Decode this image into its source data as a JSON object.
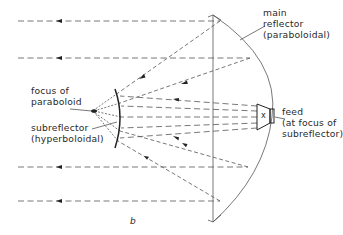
{
  "diagram": {
    "type": "cassegrain-antenna-ray-diagram",
    "caption": "b",
    "labels": {
      "main_reflector": [
        "main",
        "reflector",
        "(paraboloidal)"
      ],
      "focus": [
        "focus of",
        "paraboloid"
      ],
      "subreflector": [
        "subreflector",
        "(hyperboloidal)"
      ],
      "feed": [
        "feed",
        "(at focus of",
        "subreflector)"
      ],
      "feed_mark": "x"
    },
    "colors": {
      "line": "#555555",
      "ink": "#222222",
      "background": "#ffffff"
    }
  }
}
